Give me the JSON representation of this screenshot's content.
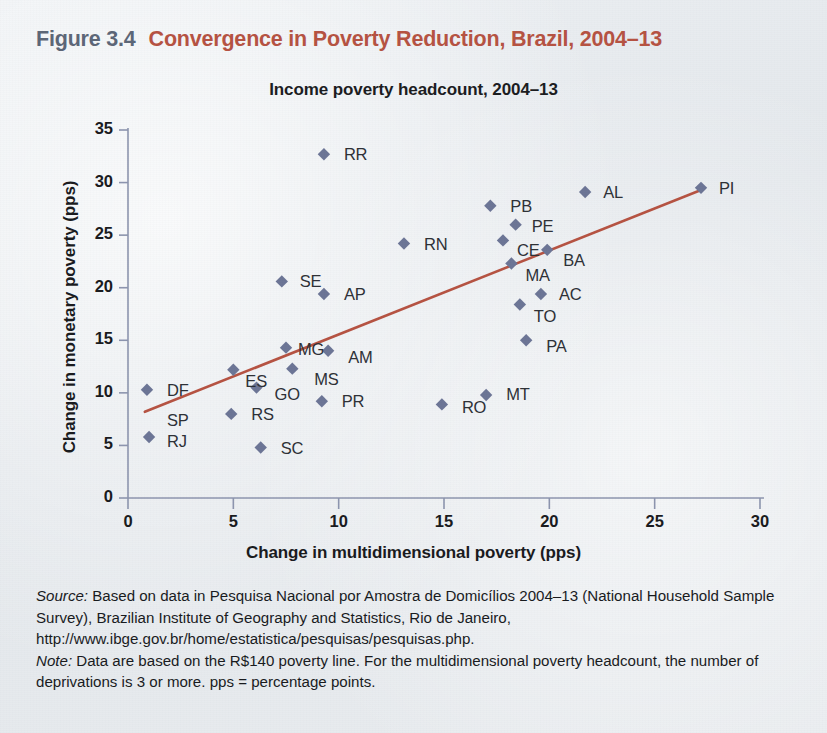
{
  "figure": {
    "number": "Figure 3.4",
    "title": "Convergence in Poverty Reduction, Brazil, 2004–13",
    "number_color": "#5a6475",
    "title_color": "#b5503f"
  },
  "notes": {
    "source_label": "Source:",
    "source_text": " Based on data in Pesquisa Nacional por Amostra de Domicílios 2004–13 (National Household Sample Survey), Brazilian Institute of Geography and Statistics, Rio de Janeiro, http://www.ibge.gov.br/home/estatistica/pesquisas/pesquisas.php.",
    "note_label": "Note:",
    "note_text": " Data are based on the R$140 poverty line. For the multidimensional poverty headcount, the number of deprivations is 3 or more. pps = percentage points."
  },
  "chart_data": {
    "type": "scatter",
    "title": "Income poverty headcount, 2004–13",
    "xlabel": "Change in multidimensional poverty (pps)",
    "ylabel": "Change in monetary poverty (pps)",
    "xlim": [
      0,
      30
    ],
    "ylim": [
      0,
      35
    ],
    "xticks": [
      "0",
      "5",
      "10",
      "15",
      "20",
      "25",
      "30"
    ],
    "yticks": [
      "0",
      "5",
      "10",
      "15",
      "20",
      "25",
      "30",
      "35"
    ],
    "grid": false,
    "legend": "none",
    "marker": "diamond",
    "marker_color": "#6a7394",
    "trendline": {
      "color": "#b5503f",
      "x_start": 0.8,
      "y_start": 8.2,
      "x_end": 27.2,
      "y_end": 29.3
    },
    "points": [
      {
        "label": "DF",
        "x": 0.9,
        "y": 10.3,
        "lx": 20,
        "ly": -9
      },
      {
        "label": "SP",
        "x": 1.0,
        "y": 5.8,
        "lx": 18,
        "ly": -26
      },
      {
        "label": "RJ",
        "x": 1.0,
        "y": 5.8,
        "lx": 18,
        "ly": -5
      },
      {
        "label": "RS",
        "x": 4.9,
        "y": 8.0,
        "lx": 20,
        "ly": -9
      },
      {
        "label": "ES",
        "x": 5.0,
        "y": 12.2,
        "lx": 12,
        "ly": 2
      },
      {
        "label": "GO",
        "x": 6.1,
        "y": 10.5,
        "lx": 18,
        "ly": -3
      },
      {
        "label": "SC",
        "x": 6.3,
        "y": 4.8,
        "lx": 20,
        "ly": -9
      },
      {
        "label": "SE",
        "x": 7.3,
        "y": 20.6,
        "lx": 18,
        "ly": -9
      },
      {
        "label": "MG",
        "x": 7.5,
        "y": 14.3,
        "lx": 12,
        "ly": -8
      },
      {
        "label": "MS",
        "x": 7.8,
        "y": 12.3,
        "lx": 22,
        "ly": 1
      },
      {
        "label": "PR",
        "x": 9.2,
        "y": 9.2,
        "lx": 20,
        "ly": -9
      },
      {
        "label": "RR",
        "x": 9.3,
        "y": 32.7,
        "lx": 20,
        "ly": -9
      },
      {
        "label": "AP",
        "x": 9.3,
        "y": 19.4,
        "lx": 20,
        "ly": -9
      },
      {
        "label": "AM",
        "x": 9.5,
        "y": 14.0,
        "lx": 20,
        "ly": -3
      },
      {
        "label": "RN",
        "x": 13.1,
        "y": 24.2,
        "lx": 20,
        "ly": -9
      },
      {
        "label": "RO",
        "x": 14.9,
        "y": 8.9,
        "lx": 20,
        "ly": -6
      },
      {
        "label": "MT",
        "x": 17.0,
        "y": 9.8,
        "lx": 20,
        "ly": -10
      },
      {
        "label": "PB",
        "x": 17.2,
        "y": 27.8,
        "lx": 20,
        "ly": -9
      },
      {
        "label": "PE",
        "x": 18.4,
        "y": 26.0,
        "lx": 16,
        "ly": -8
      },
      {
        "label": "CE",
        "x": 17.8,
        "y": 24.5,
        "lx": 14,
        "ly": 1
      },
      {
        "label": "MA",
        "x": 18.2,
        "y": 22.3,
        "lx": 14,
        "ly": 2
      },
      {
        "label": "BA",
        "x": 19.9,
        "y": 23.6,
        "lx": 16,
        "ly": 1
      },
      {
        "label": "TO",
        "x": 18.6,
        "y": 18.4,
        "lx": 14,
        "ly": 2
      },
      {
        "label": "AC",
        "x": 19.6,
        "y": 19.4,
        "lx": 18,
        "ly": -9
      },
      {
        "label": "PA",
        "x": 18.9,
        "y": 15.0,
        "lx": 20,
        "ly": -3
      },
      {
        "label": "AL",
        "x": 21.7,
        "y": 29.1,
        "lx": 18,
        "ly": -9
      },
      {
        "label": "PI",
        "x": 27.2,
        "y": 29.5,
        "lx": 18,
        "ly": -9
      }
    ]
  }
}
